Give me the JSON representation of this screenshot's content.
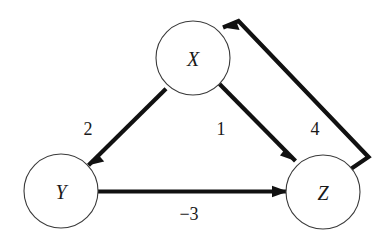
{
  "figure": {
    "background_color": "#ffffff",
    "stroke_color": "#111111",
    "node_stroke_color": "#3a3a3a",
    "node_fill_color": "#ffffff",
    "text_color": "#1a1a1a"
  },
  "nodes": [
    {
      "id": "X",
      "label": "X",
      "cx": 193,
      "cy": 58,
      "r": 37
    },
    {
      "id": "Y",
      "label": "Y",
      "cx": 61,
      "cy": 191,
      "r": 37
    },
    {
      "id": "Z",
      "label": "Z",
      "cx": 323,
      "cy": 192,
      "r": 37
    }
  ],
  "edges": [
    {
      "id": "x-to-y",
      "source": "X",
      "target": "Y",
      "weight": "2",
      "weight_x": 88,
      "weight_y": 129,
      "path": "M 166.0 88.8 L 88.5 165.3",
      "head": "88.5,165.3 104.2,161.5 99.0,155.6",
      "directed": true
    },
    {
      "id": "x-to-z",
      "source": "X",
      "target": "Z",
      "weight": "1",
      "weight_x": 221,
      "weight_y": 129,
      "path": "M 219.5 84.0 L 295.5 161.0",
      "head": "295.5,161.0 284.8,149.2 280.0,155.6",
      "directed": true
    },
    {
      "id": "y-to-z",
      "source": "Y",
      "target": "Z",
      "weight": "−3",
      "weight_x": 189,
      "weight_y": 214,
      "path": "M 98.0 191.5 L 288.0 191.5",
      "head": "288.0,191.5 272.0,185.8 272.0,197.2",
      "directed": true
    },
    {
      "id": "z-to-x",
      "source": "Z",
      "target": "X",
      "weight": "4",
      "weight_x": 315,
      "weight_y": 129,
      "path": "M 350.0 169.5 L 368.5 157.0 L 238.5 21.0 L 223.0 27.5",
      "head": "223.0,27.5 239.6,30.0 236.0,21.0",
      "directed": true
    }
  ]
}
